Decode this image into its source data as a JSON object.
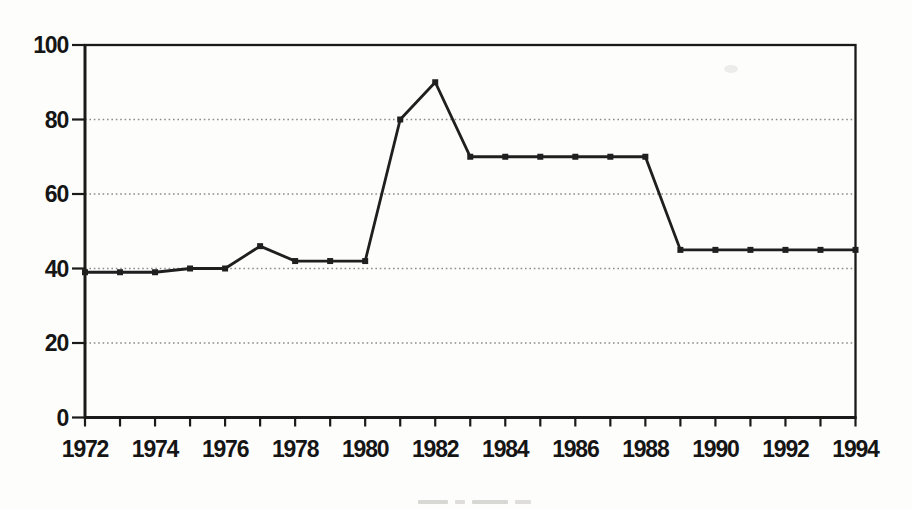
{
  "page": {
    "background": "#fdfdfc"
  },
  "chart_data": {
    "type": "line",
    "title": "",
    "xlabel": "",
    "ylabel": "",
    "x": [
      1972,
      1973,
      1974,
      1975,
      1976,
      1977,
      1978,
      1979,
      1980,
      1981,
      1982,
      1983,
      1984,
      1985,
      1986,
      1987,
      1988,
      1989,
      1990,
      1991,
      1992,
      1993,
      1994
    ],
    "values": [
      39,
      39,
      39,
      40,
      40,
      46,
      42,
      42,
      42,
      80,
      90,
      70,
      70,
      70,
      70,
      70,
      70,
      45,
      45,
      45,
      45,
      45,
      45
    ],
    "x_tick_labels": [
      "1972",
      "1974",
      "1976",
      "1978",
      "1980",
      "1982",
      "1984",
      "1986",
      "1988",
      "1990",
      "1992",
      "1994"
    ],
    "x_tick_label_years": [
      1972,
      1974,
      1976,
      1978,
      1980,
      1982,
      1984,
      1986,
      1988,
      1990,
      1992,
      1994
    ],
    "y_ticks": [
      0,
      20,
      40,
      60,
      80,
      100
    ],
    "y_tick_labels": [
      "0",
      "20",
      "40",
      "60",
      "80",
      "100"
    ],
    "xlim": [
      1972,
      1994
    ],
    "ylim": [
      0,
      100
    ],
    "grid": "horizontal dotted lines at 20, 40, 60, 80",
    "legend": "none",
    "marker": "filled-square",
    "line_color": "#1f1f1f",
    "axis_color": "#1a1a1a",
    "grid_color": "#8c8c8c",
    "label_color": "#151515"
  }
}
